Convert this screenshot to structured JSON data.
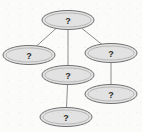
{
  "diagram": {
    "type": "graph",
    "background_color": "#fbfbfa",
    "node_fill_color": "#e2e2e2",
    "node_stroke_color": "#6e6e6e",
    "edge_color": "#8c8c8c",
    "label_color": "#2b2b2b",
    "node_count": 6,
    "edge_count": 5,
    "nodes": [
      {
        "id": "n1",
        "label": "?",
        "cx": 68,
        "cy": 20,
        "rx": 26,
        "ry": 9.5,
        "role": "root-node"
      },
      {
        "id": "n2",
        "label": "?",
        "cx": 29,
        "cy": 55,
        "rx": 26,
        "ry": 9.5,
        "role": "left-node"
      },
      {
        "id": "n3",
        "label": "?",
        "cx": 111,
        "cy": 53,
        "rx": 26,
        "ry": 9.5,
        "role": "right-node"
      },
      {
        "id": "n4",
        "label": "?",
        "cx": 68,
        "cy": 75,
        "rx": 26,
        "ry": 9.5,
        "role": "center-node"
      },
      {
        "id": "n5",
        "label": "?",
        "cx": 111,
        "cy": 94,
        "rx": 26,
        "ry": 9.5,
        "role": "lower-right-node"
      },
      {
        "id": "n6",
        "label": "?",
        "cx": 66,
        "cy": 117,
        "rx": 26,
        "ry": 9.5,
        "role": "bottom-node"
      }
    ],
    "edges": [
      {
        "id": "e1",
        "from": "n1",
        "to": "n2",
        "x1": 56,
        "y1": 28,
        "x2": 36,
        "y2": 46
      },
      {
        "id": "e2",
        "from": "n1",
        "to": "n4",
        "x1": 68,
        "y1": 30,
        "x2": 68,
        "y2": 66
      },
      {
        "id": "e3",
        "from": "n1",
        "to": "n3",
        "x1": 82,
        "y1": 28,
        "x2": 102,
        "y2": 44
      },
      {
        "id": "e4",
        "from": "n3",
        "to": "n5",
        "x1": 111,
        "y1": 63,
        "x2": 111,
        "y2": 85
      },
      {
        "id": "e5",
        "from": "n4",
        "to": "n6",
        "x1": 67,
        "y1": 85,
        "x2": 66,
        "y2": 108
      }
    ]
  }
}
